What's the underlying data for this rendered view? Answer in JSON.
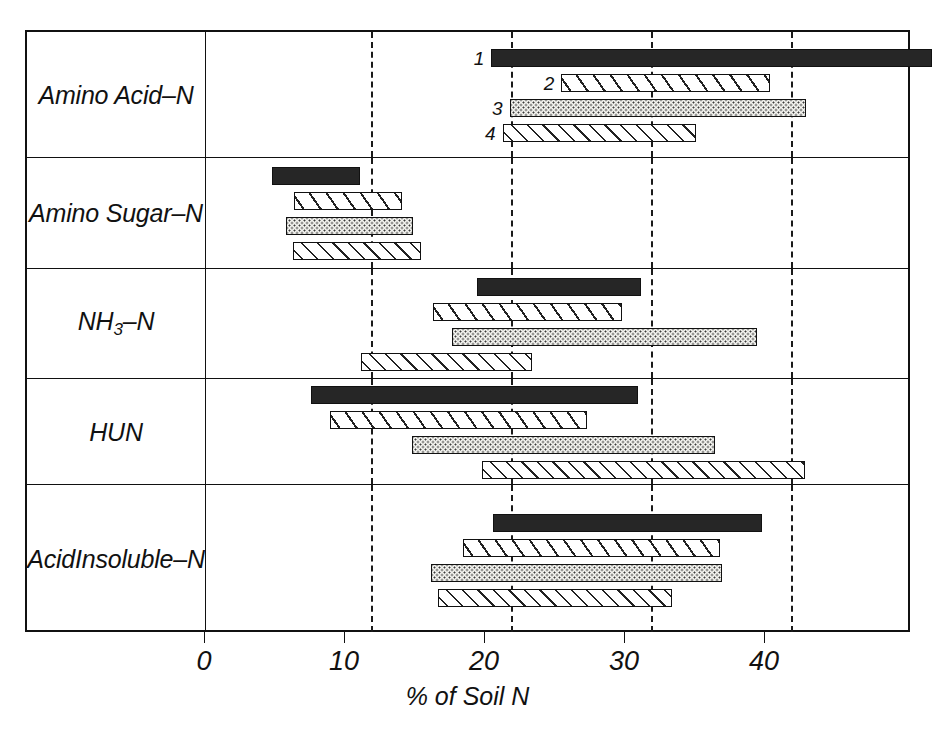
{
  "chart_data": {
    "type": "bar",
    "orientation": "horizontal",
    "title": "",
    "xlabel": "% of Soil N",
    "ylabel": "",
    "xlim": [
      0,
      50.5
    ],
    "xticks": [
      0,
      10,
      20,
      30,
      40
    ],
    "xticklabels": [
      "0",
      "10",
      "20",
      "30",
      "40"
    ],
    "grid": "vertical dashed gridlines at 10, 20, 30, 40",
    "legend": "none; bars labelled 1-4 in the top panel",
    "note": "Each bar is a floating range bar (start-to-end) showing the range of % of soil N; series 1-4 are four soils/treatments distinguished by fill pattern.",
    "series_patterns": [
      {
        "number": "1",
        "pattern": "solid-black"
      },
      {
        "number": "2",
        "pattern": "diagonal-hatch"
      },
      {
        "number": "3",
        "pattern": "stipple-dots"
      },
      {
        "number": "4",
        "pattern": "cross-hatch"
      }
    ],
    "categories": [
      "Amino Acid -N",
      "Amino Sugar -N",
      "NH3-N",
      "HUN",
      "Acid Insoluble -N"
    ],
    "panels": [
      {
        "label_lines": [
          "Amino Acid",
          "–N"
        ],
        "show_numbers": true,
        "bars": [
          {
            "number": "1",
            "pattern": "p1",
            "start": 18.6,
            "end": 50.1
          },
          {
            "number": "2",
            "pattern": "p2",
            "start": 23.6,
            "end": 38.5
          },
          {
            "number": "3",
            "pattern": "p3",
            "start": 19.9,
            "end": 41.1
          },
          {
            "number": "4",
            "pattern": "p4",
            "start": 19.4,
            "end": 33.2
          }
        ]
      },
      {
        "label_lines": [
          "Amino Sugar",
          "–N"
        ],
        "show_numbers": false,
        "bars": [
          {
            "number": "1",
            "pattern": "p1",
            "start": 2.9,
            "end": 9.2
          },
          {
            "number": "2",
            "pattern": "p2",
            "start": 4.5,
            "end": 12.2
          },
          {
            "number": "3",
            "pattern": "p3",
            "start": 3.9,
            "end": 13.0
          },
          {
            "number": "4",
            "pattern": "p4",
            "start": 4.4,
            "end": 13.6
          }
        ]
      },
      {
        "label_lines": [
          "NH3-N"
        ],
        "show_numbers": false,
        "bars": [
          {
            "number": "1",
            "pattern": "p1",
            "start": 17.6,
            "end": 29.3
          },
          {
            "number": "2",
            "pattern": "p2",
            "start": 14.4,
            "end": 27.9
          },
          {
            "number": "3",
            "pattern": "p3",
            "start": 15.8,
            "end": 37.6
          },
          {
            "number": "4",
            "pattern": "p4",
            "start": 9.3,
            "end": 21.5
          }
        ]
      },
      {
        "label_lines": [
          "HUN"
        ],
        "show_numbers": false,
        "bars": [
          {
            "number": "1",
            "pattern": "p1",
            "start": 5.7,
            "end": 29.1
          },
          {
            "number": "2",
            "pattern": "p2",
            "start": 7.1,
            "end": 25.4
          },
          {
            "number": "3",
            "pattern": "p3",
            "start": 12.9,
            "end": 34.6
          },
          {
            "number": "4",
            "pattern": "p4",
            "start": 17.9,
            "end": 41.0
          }
        ]
      },
      {
        "label_lines": [
          "Acid",
          "Insoluble",
          "–N"
        ],
        "show_numbers": false,
        "bars": [
          {
            "number": "1",
            "pattern": "p1",
            "start": 18.7,
            "end": 37.9
          },
          {
            "number": "2",
            "pattern": "p2",
            "start": 16.6,
            "end": 34.9
          },
          {
            "number": "3",
            "pattern": "p3",
            "start": 14.3,
            "end": 35.1
          },
          {
            "number": "4",
            "pattern": "p4",
            "start": 14.8,
            "end": 31.5
          }
        ]
      }
    ]
  },
  "axis": {
    "xlabel": "% of Soil N",
    "ticks": [
      "0",
      "10",
      "20",
      "30",
      "40"
    ]
  },
  "row_labels": [
    {
      "lines": [
        "Amino Acid",
        "–N"
      ],
      "subscript": null
    },
    {
      "lines": [
        "Amino Sugar",
        "–N"
      ],
      "subscript": null
    },
    {
      "lines": [
        "NH",
        "–N"
      ],
      "subscript": "3"
    },
    {
      "lines": [
        "HUN"
      ],
      "subscript": null
    },
    {
      "lines": [
        "Acid",
        "Insoluble",
        "–N"
      ],
      "subscript": null
    }
  ]
}
